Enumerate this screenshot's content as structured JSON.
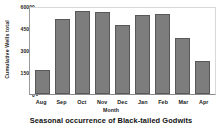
{
  "chart_data": {
    "type": "bar",
    "title": "Seasonal occurrence of Black-tailed Godwits",
    "xlabel": "Month",
    "ylabel": "Cumulative Wells total",
    "categories": [
      "Aug",
      "Sep",
      "Oct",
      "Nov",
      "Dec",
      "Jan",
      "Feb",
      "Mar",
      "Apr"
    ],
    "values": [
      17000,
      52000,
      58000,
      57000,
      48000,
      55000,
      56000,
      39000,
      23000
    ],
    "ylim": [
      0,
      60000
    ],
    "yticks": [
      0,
      15000,
      30000,
      45000,
      60000
    ],
    "ytick_labels": [
      "0",
      "15000",
      "30000",
      "45000",
      "60000"
    ],
    "grid": false,
    "legend": false,
    "bar_color": "#7d7d7d",
    "bar_edge_color": "#585858",
    "background_color": "#ffffff",
    "text_color": "#1a1a1a"
  }
}
